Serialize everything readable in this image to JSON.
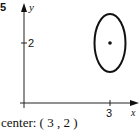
{
  "problem_number": "5",
  "axes": {
    "x_label": "x",
    "y_label": "y",
    "x_ticks": [
      {
        "value": 3,
        "label": "3"
      }
    ],
    "y_ticks": [
      {
        "value": 2,
        "label": "2"
      }
    ]
  },
  "ellipse": {
    "center": [
      3,
      2
    ],
    "orientation": "vertical major axis",
    "stroke_color": "#111111"
  },
  "caption": "center: ( 3 , 2 )"
}
